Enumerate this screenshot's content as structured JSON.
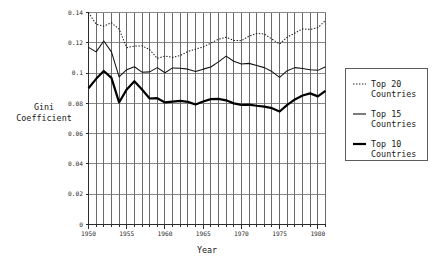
{
  "chart_data": {
    "type": "line",
    "title": "",
    "xlabel": "Year",
    "ylabel": "Gini Coefficient",
    "ylabel_lines": [
      "Gini",
      "Coefficient"
    ],
    "xlim": [
      1950,
      1981
    ],
    "ylim": [
      0,
      0.14
    ],
    "grid": true,
    "grid_vertical": "every year",
    "grid_horizontal": "every 0.02",
    "legend_position": "right-outside",
    "xticks": [
      1950,
      1955,
      1960,
      1965,
      1970,
      1975,
      1980
    ],
    "xticklabels": [
      "1950",
      "1955",
      "1960",
      "1965",
      "1970",
      "1975",
      "1980"
    ],
    "yticks": [
      0,
      0.02,
      0.04,
      0.06,
      0.08,
      0.1,
      0.12,
      0.14
    ],
    "yticklabels": [
      "0",
      "0.02",
      "0.04",
      "0.06",
      "0.08",
      "0.1",
      "0.12",
      "0.14"
    ],
    "x": [
      1950,
      1951,
      1952,
      1953,
      1954,
      1955,
      1956,
      1957,
      1958,
      1959,
      1960,
      1961,
      1962,
      1963,
      1964,
      1965,
      1966,
      1967,
      1968,
      1969,
      1970,
      1971,
      1972,
      1973,
      1974,
      1975,
      1976,
      1977,
      1978,
      1979,
      1980,
      1981
    ],
    "series": [
      {
        "name": "Top 20 Countries",
        "style": "dotted",
        "color": "#1a1a1a",
        "values": [
          0.14,
          0.1322,
          0.131,
          0.1332,
          0.129,
          0.1168,
          0.1178,
          0.118,
          0.1155,
          0.1097,
          0.1112,
          0.1104,
          0.1116,
          0.1142,
          0.1158,
          0.1172,
          0.1198,
          0.1224,
          0.1236,
          0.1216,
          0.1214,
          0.1244,
          0.1262,
          0.1258,
          0.1224,
          0.1192,
          0.1238,
          0.1264,
          0.1292,
          0.1288,
          0.13,
          0.1348
        ]
      },
      {
        "name": "Top 15 Countries",
        "style": "solid-thin",
        "color": "#111111",
        "values": [
          0.117,
          0.114,
          0.1212,
          0.114,
          0.0975,
          0.1022,
          0.1042,
          0.1006,
          0.1008,
          0.1036,
          0.1002,
          0.1034,
          0.1032,
          0.1026,
          0.101,
          0.1026,
          0.104,
          0.1074,
          0.1112,
          0.1078,
          0.106,
          0.1064,
          0.105,
          0.1036,
          0.101,
          0.0972,
          0.1016,
          0.1036,
          0.103,
          0.1022,
          0.1018,
          0.1042
        ]
      },
      {
        "name": "Top 10 Countries",
        "style": "solid-thick",
        "color": "#000000",
        "values": [
          0.09,
          0.0962,
          0.1014,
          0.0968,
          0.0806,
          0.0892,
          0.0946,
          0.0892,
          0.0832,
          0.0834,
          0.0806,
          0.0812,
          0.0816,
          0.081,
          0.0792,
          0.0812,
          0.0828,
          0.083,
          0.082,
          0.08,
          0.079,
          0.0792,
          0.0784,
          0.0778,
          0.0768,
          0.0746,
          0.079,
          0.0826,
          0.0852,
          0.0866,
          0.0846,
          0.0882
        ]
      }
    ]
  },
  "legend": {
    "items": [
      {
        "label_line1": "Top 20",
        "label_line2": "Countries",
        "style": "dotted"
      },
      {
        "label_line1": "Top 15",
        "label_line2": "Countries",
        "style": "solid-thin"
      },
      {
        "label_line1": "Top 10",
        "label_line2": "Countries",
        "style": "solid-thick"
      }
    ]
  }
}
